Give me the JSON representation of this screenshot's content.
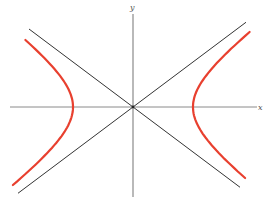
{
  "chart_data": {
    "type": "line",
    "title": "",
    "xlabel": "x",
    "ylabel": "y",
    "grid": false,
    "legend": null,
    "parameters": {
      "a": 60,
      "b": 45,
      "asymptote_slope": 0.75
    },
    "origin_px": [
      133,
      107
    ],
    "series": [
      {
        "name": "hyperbola-right-branch",
        "color": "#e8402f",
        "x": [
          194,
          200,
          210,
          225,
          245,
          265
        ],
        "y": [
          0,
          14.6,
          26.4,
          40.2,
          57.4,
          73.8
        ]
      },
      {
        "name": "hyperbola-left-branch",
        "color": "#e8402f",
        "mirror_of": "hyperbola-right-branch"
      },
      {
        "name": "asymptote-positive",
        "color": "#333333",
        "equation": "y = 0.75x",
        "x_range": [
          -115,
          113
        ]
      },
      {
        "name": "asymptote-negative",
        "color": "#333333",
        "equation": "y = -0.75x",
        "x_range": [
          -104,
          107
        ]
      }
    ],
    "axes": {
      "x_axis": {
        "from_px": 10,
        "to_px": 257,
        "label": "x"
      },
      "y_axis": {
        "from_px": 14,
        "to_px": 197,
        "label": "y"
      }
    },
    "colors": {
      "curve": "#e8402f",
      "asymptote": "#333333",
      "axis": "#8a8a8a"
    }
  }
}
